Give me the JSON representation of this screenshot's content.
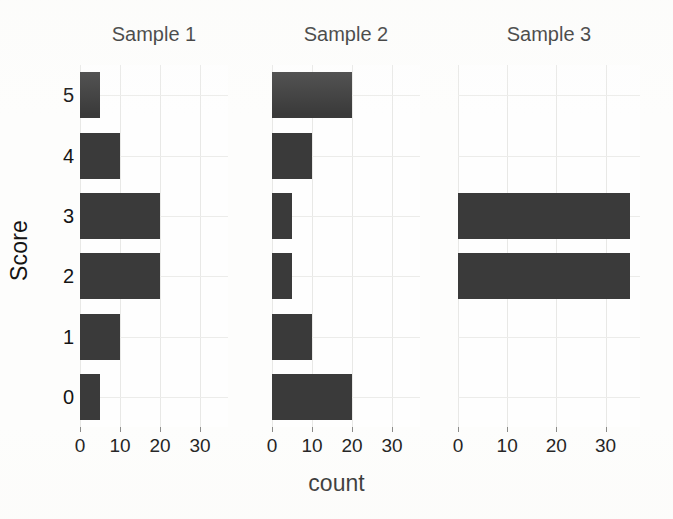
{
  "chart_data": {
    "type": "bar",
    "orientation": "horizontal",
    "title": "",
    "xlabel": "count",
    "ylabel": "Score",
    "xlim": [
      0,
      37
    ],
    "xticks": [
      0,
      10,
      20,
      30
    ],
    "xtick_labels": [
      "0",
      "10",
      "20",
      "30"
    ],
    "categories": [
      "5",
      "4",
      "3",
      "2",
      "1",
      "0"
    ],
    "category_order": "top-to-bottom",
    "ylim": [
      -0.5,
      5.5
    ],
    "grid": true,
    "legend": false,
    "panel_layout": "1 row x 3 columns",
    "bar_color": "#3a3a3a",
    "background_color": "#fdfdfc",
    "gridline_color": "#e8e8e6",
    "panels": [
      {
        "title": "Sample 1",
        "categories": [
          "5",
          "4",
          "3",
          "2",
          "1",
          "0"
        ],
        "values": [
          5,
          10,
          20,
          20,
          10,
          5
        ]
      },
      {
        "title": "Sample 2",
        "categories": [
          "5",
          "4",
          "3",
          "2",
          "1",
          "0"
        ],
        "values": [
          20,
          10,
          5,
          5,
          10,
          20
        ]
      },
      {
        "title": "Sample 3",
        "categories": [
          "5",
          "4",
          "3",
          "2",
          "1",
          "0"
        ],
        "values": [
          0,
          0,
          35,
          35,
          0,
          0
        ]
      }
    ]
  }
}
